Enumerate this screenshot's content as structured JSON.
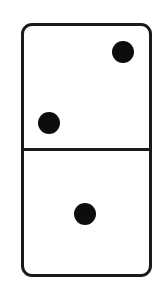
{
  "figure": {
    "orientation": "vertical",
    "colors": {
      "background": "#ffffff",
      "outline": "#1a1a1a",
      "pip": "#0d0d0d",
      "face": "#ffffff"
    },
    "halves": [
      {
        "position": "top",
        "pip_count": 2,
        "pips": [
          {
            "location": "upper-right",
            "cx": 123,
            "cy": 52
          },
          {
            "location": "lower-left",
            "cx": 49,
            "cy": 123
          }
        ]
      },
      {
        "position": "bottom",
        "pip_count": 1,
        "pips": [
          {
            "location": "center",
            "cx": 85,
            "cy": 214
          }
        ]
      }
    ]
  }
}
